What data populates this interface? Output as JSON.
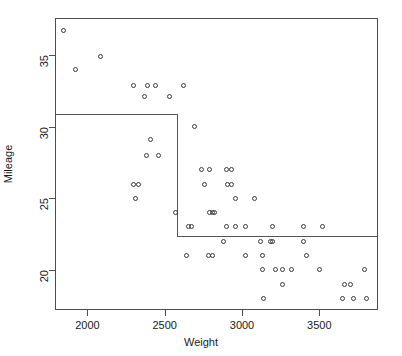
{
  "chart_data": {
    "type": "scatter",
    "title": "",
    "xlabel": "Weight",
    "ylabel": "Mileage",
    "xlim": [
      1790,
      3880
    ],
    "ylim": [
      17.2,
      37.6
    ],
    "xticks": [
      2000,
      2500,
      3000,
      3500
    ],
    "yticks": [
      20,
      25,
      30,
      35
    ],
    "grid": false,
    "legend": null,
    "marker": "open-circle",
    "points": [
      {
        "x": 1845,
        "y": 36.7
      },
      {
        "x": 2085,
        "y": 34.9
      },
      {
        "x": 1925,
        "y": 34.0
      },
      {
        "x": 2300,
        "y": 32.9
      },
      {
        "x": 2390,
        "y": 32.9
      },
      {
        "x": 2440,
        "y": 32.9
      },
      {
        "x": 2620,
        "y": 32.9
      },
      {
        "x": 2370,
        "y": 32.1
      },
      {
        "x": 2530,
        "y": 32.1
      },
      {
        "x": 2690,
        "y": 30.0
      },
      {
        "x": 2410,
        "y": 29.1
      },
      {
        "x": 2380,
        "y": 28.0
      },
      {
        "x": 2460,
        "y": 28.0
      },
      {
        "x": 2735,
        "y": 27.0
      },
      {
        "x": 2790,
        "y": 27.0
      },
      {
        "x": 2900,
        "y": 27.0
      },
      {
        "x": 2930,
        "y": 27.0
      },
      {
        "x": 2300,
        "y": 26.0
      },
      {
        "x": 2330,
        "y": 26.0
      },
      {
        "x": 2760,
        "y": 26.0
      },
      {
        "x": 2905,
        "y": 26.0
      },
      {
        "x": 2935,
        "y": 26.0
      },
      {
        "x": 2310,
        "y": 25.0
      },
      {
        "x": 2960,
        "y": 25.0
      },
      {
        "x": 3080,
        "y": 25.0
      },
      {
        "x": 2570,
        "y": 24.0
      },
      {
        "x": 2790,
        "y": 24.0
      },
      {
        "x": 2810,
        "y": 24.0
      },
      {
        "x": 2820,
        "y": 24.0
      },
      {
        "x": 2655,
        "y": 23.0
      },
      {
        "x": 2670,
        "y": 23.0
      },
      {
        "x": 2900,
        "y": 23.0
      },
      {
        "x": 2960,
        "y": 23.0
      },
      {
        "x": 3020,
        "y": 23.0
      },
      {
        "x": 3200,
        "y": 23.0
      },
      {
        "x": 3400,
        "y": 23.0
      },
      {
        "x": 3520,
        "y": 23.0
      },
      {
        "x": 2880,
        "y": 22.0
      },
      {
        "x": 3120,
        "y": 22.0
      },
      {
        "x": 3185,
        "y": 22.0
      },
      {
        "x": 3200,
        "y": 22.0
      },
      {
        "x": 3395,
        "y": 22.0
      },
      {
        "x": 2640,
        "y": 21.0
      },
      {
        "x": 2780,
        "y": 21.0
      },
      {
        "x": 2810,
        "y": 21.0
      },
      {
        "x": 3025,
        "y": 21.0
      },
      {
        "x": 3130,
        "y": 21.0
      },
      {
        "x": 3415,
        "y": 21.0
      },
      {
        "x": 3135,
        "y": 20.0
      },
      {
        "x": 3215,
        "y": 20.0
      },
      {
        "x": 3260,
        "y": 20.0
      },
      {
        "x": 3320,
        "y": 20.0
      },
      {
        "x": 3500,
        "y": 20.0
      },
      {
        "x": 3790,
        "y": 20.0
      },
      {
        "x": 3260,
        "y": 19.0
      },
      {
        "x": 3660,
        "y": 19.0
      },
      {
        "x": 3705,
        "y": 19.0
      },
      {
        "x": 3140,
        "y": 18.0
      },
      {
        "x": 3650,
        "y": 18.0
      },
      {
        "x": 3720,
        "y": 18.0
      },
      {
        "x": 3805,
        "y": 18.0
      }
    ],
    "partition_lines": [
      {
        "orientation": "horizontal",
        "y": 30.9,
        "x_start": 1790,
        "x_end": 2580
      },
      {
        "orientation": "vertical",
        "x": 2580,
        "y_start": 22.4,
        "y_end": 30.9
      },
      {
        "orientation": "horizontal",
        "y": 22.4,
        "x_start": 2580,
        "x_end": 3880
      }
    ]
  }
}
